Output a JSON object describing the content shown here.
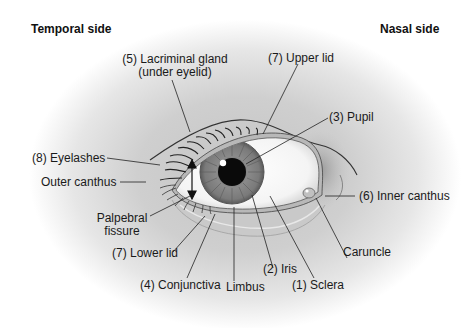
{
  "diagram": {
    "type": "anatomical-illustration",
    "orientation": {
      "left": "Temporal side",
      "right": "Nasal side"
    },
    "labels": [
      {
        "id": "lacrimal-gland",
        "number": 5,
        "text": "(5) Lacriminal gland",
        "text2": "(under eyelid)"
      },
      {
        "id": "upper-lid",
        "number": 7,
        "text": "(7) Upper lid"
      },
      {
        "id": "pupil",
        "number": 3,
        "text": "(3) Pupil"
      },
      {
        "id": "eyelashes",
        "number": 8,
        "text": "(8) Eyelashes"
      },
      {
        "id": "outer-canthus",
        "number": null,
        "text": "Outer canthus"
      },
      {
        "id": "inner-canthus",
        "number": 6,
        "text": "(6) Inner canthus"
      },
      {
        "id": "palpebral-fissure",
        "number": null,
        "text": "Palpebral",
        "text2": "fissure"
      },
      {
        "id": "lower-lid",
        "number": 7,
        "text": "(7) Lower lid"
      },
      {
        "id": "caruncle",
        "number": null,
        "text": "Caruncle"
      },
      {
        "id": "iris",
        "number": 2,
        "text": "(2) Iris"
      },
      {
        "id": "conjunctiva",
        "number": 4,
        "text": "(4) Conjunctiva"
      },
      {
        "id": "limbus",
        "number": null,
        "text": "Limbus"
      },
      {
        "id": "sclera",
        "number": 1,
        "text": "(1) Sclera"
      }
    ],
    "colors": {
      "shade": "#9a9a9a",
      "skin": "#c8c8c8",
      "iris": "#7a7a7a",
      "pupil": "#0a0a0a",
      "sclera": "#ffffff",
      "leader_line": "#222222"
    }
  }
}
